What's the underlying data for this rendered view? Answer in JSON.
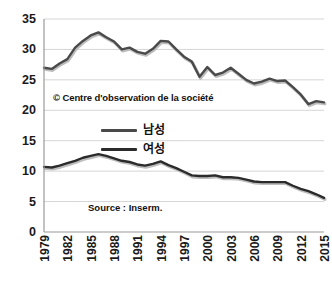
{
  "chart_data": {
    "type": "line",
    "title": "",
    "subtitle": "",
    "xlabel": "",
    "ylabel": "",
    "grid": true,
    "legend_position": "inside-center",
    "xlim": [
      1979,
      2015
    ],
    "ylim": [
      0,
      35
    ],
    "y_ticks": [
      0,
      5,
      10,
      15,
      20,
      25,
      30,
      35
    ],
    "x_ticks": [
      1979,
      1982,
      1985,
      1988,
      1991,
      1994,
      1997,
      2000,
      2003,
      2006,
      2009,
      2012,
      2015
    ],
    "x": [
      1979,
      1980,
      1981,
      1982,
      1983,
      1984,
      1985,
      1986,
      1987,
      1988,
      1989,
      1990,
      1991,
      1992,
      1993,
      1994,
      1995,
      1996,
      1997,
      1998,
      1999,
      2000,
      2001,
      2002,
      2003,
      2004,
      2005,
      2006,
      2007,
      2008,
      2009,
      2010,
      2011,
      2012,
      2013,
      2014,
      2015
    ],
    "series": [
      {
        "name": "남성",
        "color": "#4a4a4a",
        "values": [
          27.0,
          26.8,
          27.7,
          28.4,
          30.3,
          31.4,
          32.3,
          32.8,
          32.0,
          31.3,
          30.0,
          30.3,
          29.6,
          29.3,
          30.1,
          31.4,
          31.3,
          30.0,
          28.8,
          28.0,
          25.5,
          27.1,
          25.8,
          26.2,
          27.0,
          26.0,
          25.0,
          24.4,
          24.7,
          25.2,
          24.8,
          24.9,
          23.8,
          22.6,
          21.0,
          21.5,
          21.3
        ]
      },
      {
        "name": "여성",
        "color": "#2b2b2b",
        "values": [
          10.7,
          10.6,
          10.9,
          11.3,
          11.7,
          12.2,
          12.5,
          12.8,
          12.5,
          12.1,
          11.7,
          11.5,
          11.1,
          10.9,
          11.2,
          11.6,
          11.0,
          10.5,
          9.9,
          9.3,
          9.2,
          9.2,
          9.3,
          9.0,
          9.0,
          8.9,
          8.6,
          8.3,
          8.2,
          8.2,
          8.2,
          8.2,
          7.6,
          7.1,
          6.7,
          6.2,
          5.6
        ]
      }
    ],
    "annotations": [
      {
        "name": "credit",
        "text": "© Centre d'observation de la société"
      },
      {
        "name": "source",
        "text": "Source : Inserm."
      }
    ]
  },
  "labels": {
    "y_ticks": [
      "35",
      "30",
      "25",
      "20",
      "15",
      "10",
      "5",
      "0"
    ],
    "x_ticks": [
      "1979",
      "1982",
      "1985",
      "1988",
      "1991",
      "1994",
      "1997",
      "2000",
      "2003",
      "2006",
      "2009",
      "2012",
      "2015"
    ]
  },
  "legend": {
    "items": [
      {
        "label": "남성",
        "color": "#4a4a4a"
      },
      {
        "label": "여성",
        "color": "#2b2b2b"
      }
    ]
  },
  "notes": {
    "credit": "© Centre d'observation de la société",
    "source": "Source : Inserm."
  },
  "colors": {
    "male_line": "#4a4a4a",
    "female_line": "#2b2b2b",
    "grid": "#d5d5d5",
    "axis": "#9a9a9a",
    "text": "#1a1a1a",
    "background": "#ffffff"
  }
}
